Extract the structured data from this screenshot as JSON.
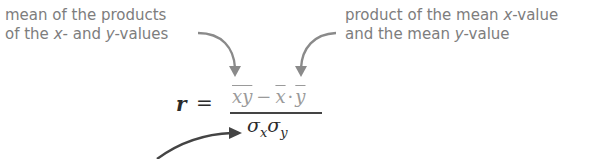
{
  "annotations": {
    "left": {
      "line1": "mean of the products",
      "line2_pre": "of the ",
      "line2_x": "x",
      "line2_mid": "- and ",
      "line2_y": "y",
      "line2_post": "-values"
    },
    "right": {
      "line1_pre": "product of the mean ",
      "line1_x": "x",
      "line1_post": "-value",
      "line2_pre": "and the mean ",
      "line2_y": "y",
      "line2_post": "-value"
    }
  },
  "formula": {
    "lhs": "r",
    "equals": "=",
    "numerator": {
      "term1": "xy",
      "minus": "−",
      "term2": "x",
      "dot": "·",
      "term3": "y"
    },
    "denominator": {
      "sigma1": "σ",
      "sub1": "x",
      "sigma2": "σ",
      "sub2": "y"
    }
  },
  "colors": {
    "annotation_text": "#7d7d7d",
    "top_arrows": "#8a8a8a",
    "bottom_arrow": "#444444",
    "numerator": "#9a9a9a",
    "formula_dark": "#2b2b2b"
  }
}
